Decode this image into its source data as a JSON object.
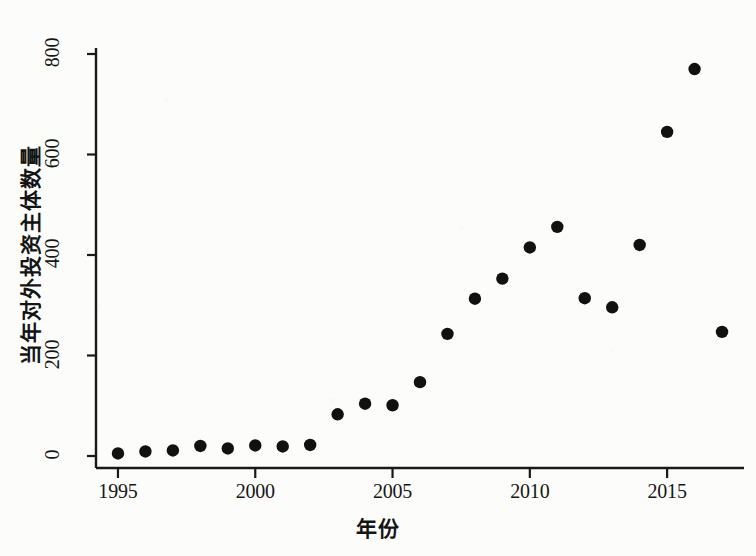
{
  "chart_data": {
    "type": "scatter",
    "title": "",
    "xlabel": "年份",
    "ylabel": "当年对外投资主体数量",
    "xlim": [
      1994.2,
      1017.8
    ],
    "x_axis_min": 1994.2,
    "x_axis_max": 2017.8,
    "ylim": [
      -30,
      830
    ],
    "y_axis_min": -30,
    "y_axis_max": 830,
    "xticks": [
      "1995",
      "2000",
      "2005",
      "2010",
      "2015"
    ],
    "xtick_values": [
      1995,
      2000,
      2005,
      2010,
      2015
    ],
    "yticks": [
      "0",
      "200",
      "400",
      "600",
      "800"
    ],
    "ytick_values": [
      0,
      200,
      400,
      600,
      800
    ],
    "grid": false,
    "legend": "none",
    "marker": "filled-circle",
    "marker_color": "#111111",
    "x": [
      1995,
      1996,
      1997,
      1998,
      1999,
      2000,
      2001,
      2002,
      2003,
      2004,
      2005,
      2006,
      2007,
      2008,
      2009,
      2010,
      2011,
      2012,
      2013,
      2014,
      2015,
      2016,
      2017
    ],
    "values": [
      5,
      9,
      11,
      20,
      15,
      21,
      19,
      22,
      83,
      104,
      101,
      147,
      243,
      313,
      353,
      415,
      456,
      314,
      296,
      420,
      645,
      770,
      247
    ],
    "series": [
      {
        "name": "当年对外投资主体数量",
        "x": [
          1995,
          1996,
          1997,
          1998,
          1999,
          2000,
          2001,
          2002,
          2003,
          2004,
          2005,
          2006,
          2007,
          2008,
          2009,
          2010,
          2011,
          2012,
          2013,
          2014,
          2015,
          2016,
          2017
        ],
        "values": [
          5,
          9,
          11,
          20,
          15,
          21,
          19,
          22,
          83,
          104,
          101,
          147,
          243,
          313,
          353,
          415,
          456,
          314,
          296,
          420,
          645,
          770,
          247
        ]
      }
    ]
  },
  "axes": {
    "x_title": "年份",
    "y_title": "当年对外投资主体数量"
  }
}
